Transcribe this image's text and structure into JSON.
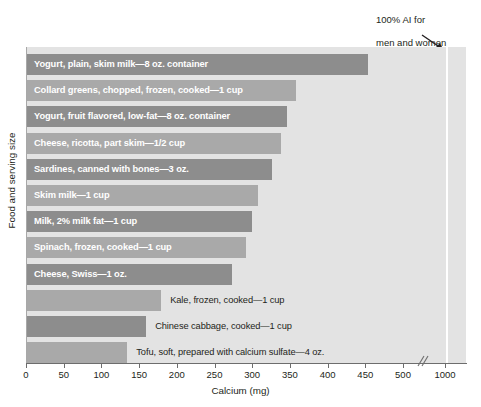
{
  "chart_data": {
    "type": "bar",
    "orientation": "horizontal",
    "title": "",
    "xlabel": "Calcium (mg)",
    "ylabel": "Food and serving size",
    "xlim": [
      0,
      500
    ],
    "xticks": [
      0,
      50,
      100,
      150,
      200,
      250,
      300,
      350,
      400,
      450,
      500,
      1000
    ],
    "xtick_labels": [
      "0",
      "50",
      "100",
      "150",
      "200",
      "250",
      "300",
      "350",
      "400",
      "450",
      "500",
      "1000"
    ],
    "axis_break": true,
    "axis_break_after": 500,
    "grid": false,
    "legend": "none",
    "reference_line": {
      "value": 1000,
      "label": "100% AI for\nmen and women\naged 19–50 years",
      "color": "#ffffff"
    },
    "categories": [
      "Yogurt, plain, skim milk—8 oz. container",
      "Collard greens, chopped, frozen, cooked—1 cup",
      "Yogurt, fruit flavored, low-fat—8 oz. container",
      "Cheese, ricotta, part skim—1/2 cup",
      "Sardines, canned with bones—3 oz.",
      "Skim milk—1 cup",
      "Milk, 2% milk fat—1 cup",
      "Spinach, frozen, cooked—1 cup",
      "Cheese, Swiss—1 oz.",
      "Kale, frozen, cooked—1 cup",
      "Chinese cabbage, cooked—1 cup",
      "Tofu, soft, prepared with calcium sulfate—4 oz."
    ],
    "values": [
      452,
      357,
      345,
      337,
      325,
      306,
      298,
      291,
      272,
      178,
      158,
      133
    ],
    "bar_colors": [
      "#8d8d8d",
      "#a9a9a9",
      "#8d8d8d",
      "#a9a9a9",
      "#8d8d8d",
      "#a9a9a9",
      "#8d8d8d",
      "#a9a9a9",
      "#8d8d8d",
      "#a9a9a9",
      "#8d8d8d",
      "#a9a9a9"
    ],
    "label_placement": [
      "inside",
      "inside",
      "inside",
      "inside",
      "inside",
      "inside",
      "inside",
      "inside",
      "inside",
      "outside",
      "outside",
      "outside"
    ]
  },
  "annotation": {
    "line1": "100% AI for",
    "line2": "men and women",
    "line3": "aged 19–50 years"
  },
  "axis": {
    "x_title": "Calcium (mg)",
    "y_title": "Food and serving size"
  }
}
